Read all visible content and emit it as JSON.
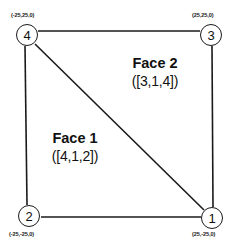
{
  "diagram": {
    "background_color": "#ffffff",
    "line_color": "#1a1a1a",
    "nodes": [
      {
        "id": "1",
        "label": "1",
        "coord": "(25,-25,0)",
        "cx": 212,
        "cy": 218
      },
      {
        "id": "2",
        "label": "2",
        "coord": "(-25,-25,0)",
        "cx": 29,
        "cy": 216
      },
      {
        "id": "3",
        "label": "3",
        "coord": "(25,25,0)",
        "cx": 211,
        "cy": 35
      },
      {
        "id": "4",
        "label": "4",
        "coord": "(-25,25,0)",
        "cx": 27,
        "cy": 35
      }
    ],
    "edges": [
      {
        "from": "4",
        "to": "3",
        "name": "edge-top"
      },
      {
        "from": "4",
        "to": "2",
        "name": "edge-left"
      },
      {
        "from": "2",
        "to": "1",
        "name": "edge-bottom"
      },
      {
        "from": "3",
        "to": "1",
        "name": "edge-right"
      },
      {
        "from": "4",
        "to": "1",
        "name": "edge-diagonal"
      }
    ],
    "faces": [
      {
        "id": "face-1",
        "title": "Face 1",
        "vertices": "([4,1,2])",
        "x": 44,
        "y": 130
      },
      {
        "id": "face-2",
        "title": "Face 2",
        "vertices": "([3,1,4])",
        "x": 110,
        "y": 55
      }
    ]
  }
}
